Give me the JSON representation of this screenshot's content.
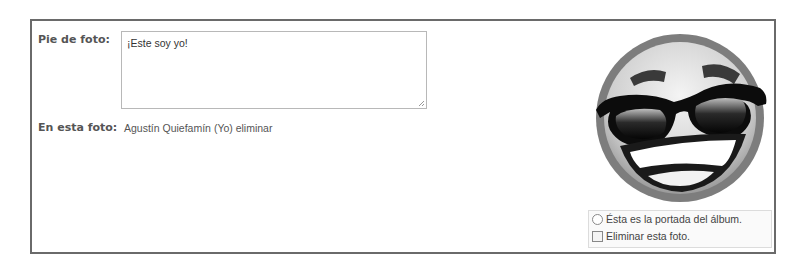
{
  "caption": {
    "label": "Pie de foto:",
    "value": "¡Este soy yo!"
  },
  "tagged": {
    "label": "En esta foto:",
    "person": "Agustín Quiefamín (Yo)",
    "remove_link": "eliminar"
  },
  "photo": {
    "icon": "smiley-sunglasses-icon"
  },
  "options": {
    "album_cover_label": "Ésta es la portada del álbum.",
    "album_cover_selected": false,
    "delete_photo_label": "Eliminar esta foto.",
    "delete_photo_checked": false
  },
  "colors": {
    "border": "#6a6a6a",
    "label": "#555555",
    "text": "#333333"
  }
}
